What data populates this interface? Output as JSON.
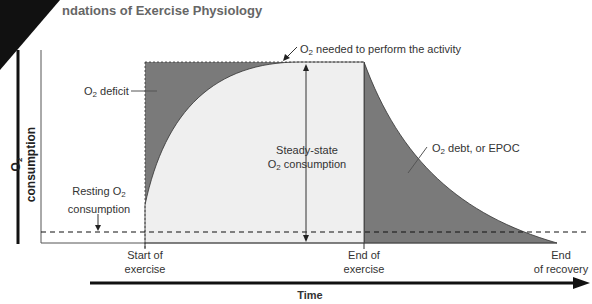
{
  "header": {
    "title": "ndations of Exercise Physiology"
  },
  "axes": {
    "ylabel_prefix": "O",
    "ylabel_sub": "2",
    "ylabel_suffix": " consumption",
    "xlabel": "Time"
  },
  "labels": {
    "needed_pre": "O",
    "needed_sub": "2",
    "needed_post": " needed to perform the activity",
    "deficit_pre": "O",
    "deficit_sub": "2",
    "deficit_post": " deficit",
    "steady_line1": "Steady-state",
    "steady_pre": "O",
    "steady_sub": "2",
    "steady_post": " consumption",
    "debt_pre": "O",
    "debt_sub": "2",
    "debt_post": " debt, or EPOC",
    "resting_pre": "Resting O",
    "resting_sub": "2",
    "resting_line2": "consumption",
    "start_line1": "Start of",
    "start_line2": "exercise",
    "end_line1": "End of",
    "end_line2": "exercise",
    "recovery_line1": "End",
    "recovery_line2": "of recovery"
  },
  "colors": {
    "dark_fill": "#7a7a7a",
    "light_fill": "#efefef",
    "line": "#333333"
  }
}
